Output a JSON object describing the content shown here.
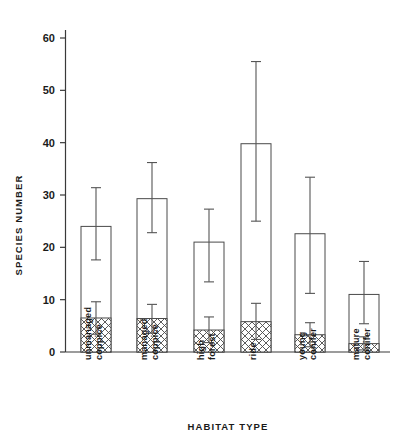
{
  "chart_data": {
    "type": "bar",
    "title": "",
    "subtitle": "",
    "xlabel": "HABITAT  TYPE",
    "ylabel": "SPECIES  NUMBER",
    "categories": [
      "unmanaged coppice",
      "managed coppice",
      "high forest",
      "ride",
      "young conifer",
      "mature conifer"
    ],
    "category_lines": [
      [
        "unmanaged",
        "coppice"
      ],
      [
        "managed",
        "coppice"
      ],
      [
        "high",
        "forest"
      ],
      [
        "ride"
      ],
      [
        "young",
        "conifer"
      ],
      [
        "mature",
        "conifer"
      ]
    ],
    "ylim": [
      0,
      63
    ],
    "yticks": [
      0,
      10,
      20,
      30,
      40,
      50,
      60
    ],
    "ytick_labels": [
      "0",
      "10",
      "20",
      "30",
      "40",
      "50",
      "60"
    ],
    "grid": false,
    "legend": "none",
    "series": [
      {
        "name": "total species number",
        "style": "open",
        "values": [
          24.0,
          29.3,
          21.0,
          39.8,
          22.6,
          11.0
        ],
        "errors_upper": [
          31.4,
          36.2,
          27.3,
          55.5,
          33.4,
          17.3
        ],
        "errors_lower": [
          17.6,
          22.8,
          13.4,
          25.0,
          11.2,
          5.4
        ]
      },
      {
        "name": "hatched subset",
        "style": "cross-hatch",
        "values": [
          6.5,
          6.4,
          4.2,
          5.8,
          3.3,
          1.6
        ],
        "errors_upper": [
          9.6,
          9.1,
          6.7,
          9.3,
          5.6,
          2.9
        ],
        "errors_lower": [
          3.4,
          3.6,
          1.8,
          2.4,
          1.0,
          0.4
        ]
      }
    ],
    "colors": {
      "axis": "#3a3a3a",
      "bar_outline": "#4a4a4a",
      "bar_fill": "#ffffff",
      "hatch": "#4a4a4a",
      "error_bar": "#555555",
      "text": "#1a1a1a",
      "background": "#ffffff"
    }
  }
}
